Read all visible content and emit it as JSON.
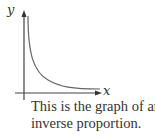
{
  "figure": {
    "y_axis_label": "y",
    "x_axis_label": "x",
    "curve": "inverse proportion (y = k/x)",
    "caption_lines": [
      "This is the graph of an",
      "inverse proportion."
    ]
  },
  "colors": {
    "axis": "#444444",
    "curve": "#666666",
    "text": "#333333"
  }
}
